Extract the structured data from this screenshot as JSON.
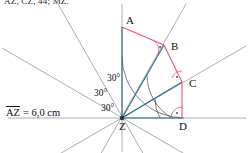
{
  "figure": {
    "top_note": "AZ, CZ, 44; MZ.",
    "measure_label": "AZ",
    "measure_value": "= 6,0 cm",
    "colors": {
      "ray": "#8a8a8a",
      "radius": "#2b6b8f",
      "perpendicular": "#e8547c",
      "baseline": "#8a8a8a",
      "text": "#111111",
      "arc": "#4a4a4a"
    },
    "points": [
      {
        "name": "A",
        "x": 122,
        "y": 27,
        "label_dx": 4,
        "label_dy": -12
      },
      {
        "name": "B",
        "x": 164,
        "y": 45,
        "label_dx": 7,
        "label_dy": -4
      },
      {
        "name": "C",
        "x": 182,
        "y": 82,
        "label_dx": 7,
        "label_dy": -4
      },
      {
        "name": "D",
        "x": 182,
        "y": 118,
        "label_dx": -3,
        "label_dy": 3
      },
      {
        "name": "Z",
        "x": 122,
        "y": 118,
        "label_dx": -3,
        "label_dy": 3
      }
    ],
    "angles": [
      {
        "value": "30°",
        "x": 101,
        "y": 104
      },
      {
        "value": "30°",
        "x": 94,
        "y": 89
      },
      {
        "value": "30°",
        "x": 107,
        "y": 74
      }
    ],
    "right_angles": [
      "B",
      "C",
      "D"
    ],
    "segments": {
      "radii": [
        "ZA",
        "ZB",
        "ZC",
        "ZD"
      ],
      "perpendiculars": [
        "AB",
        "BC",
        "CD"
      ]
    },
    "ray_count": 7,
    "ray_step_degrees": 30
  }
}
